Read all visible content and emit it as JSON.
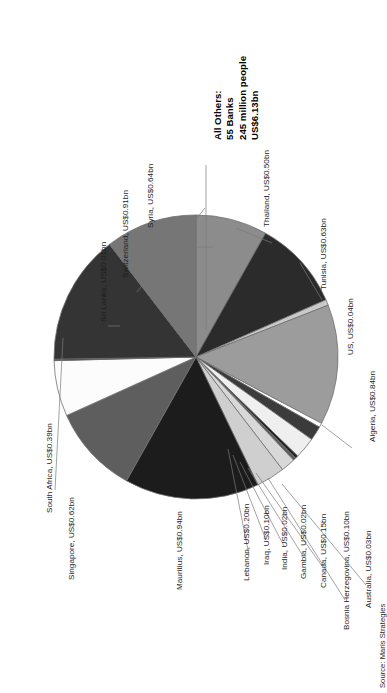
{
  "source_note": "Source: Maris Strategies",
  "callout": {
    "line1": "All Others:",
    "line2": "55 Banks",
    "line3": "245 million people",
    "line4": "US$6.13bn"
  },
  "labels": {
    "thailand": "Thailand, US$0.50bn",
    "tunisia": "Tunisia, US$0.63bn",
    "us": "US, US$0.04bn",
    "algeria": "Algeria, US$0.84bn",
    "australia": "Australia, US$0.03bn",
    "bosnia": "Bosnia Herzegovina, US$0.10bn",
    "canada": "Canada, US$0.15bn",
    "gambia": "Gambia, US$0.02bn",
    "india": "India, US$0.02bn",
    "iraq": "Iraq, US$0.10bn",
    "lebanon": "Lebanon, US$0.20bn",
    "mauritius": "Mauritius, US$0.94bn",
    "singapore": "Singapore, US$0.62bn",
    "south_africa": "South Africa, US$0.39bn",
    "sri_lanka": "Sri Lanka, US$0.01bn",
    "switzerland": "Switzerland, US$0.91bn",
    "syria": "Syria, US$0.64bn"
  },
  "chart_data": {
    "type": "pie",
    "title": "",
    "unit": "US$ billion",
    "legend_position": "none",
    "labels_style": "outside-with-leader-lines",
    "rotation_deg": -90,
    "categories": [
      "Thailand",
      "Tunisia",
      "US",
      "Algeria",
      "Australia",
      "Bosnia Herzegovina",
      "Canada",
      "Gambia",
      "India",
      "Iraq",
      "Lebanon",
      "Mauritius",
      "Singapore",
      "South Africa",
      "Sri Lanka",
      "Switzerland",
      "Syria"
    ],
    "values": [
      0.5,
      0.63,
      0.04,
      0.84,
      0.03,
      0.1,
      0.15,
      0.02,
      0.02,
      0.1,
      0.2,
      0.94,
      0.62,
      0.39,
      0.01,
      0.91,
      0.64
    ],
    "value_labels": [
      "US$0.50bn",
      "US$0.63bn",
      "US$0.04bn",
      "US$0.84bn",
      "US$0.03bn",
      "US$0.10bn",
      "US$0.15bn",
      "US$0.02bn",
      "US$0.02bn",
      "US$0.10bn",
      "US$0.20bn",
      "US$0.94bn",
      "US$0.62bn",
      "US$0.39bn",
      "US$0.01bn",
      "US$0.91bn",
      "US$0.64bn"
    ],
    "colors": [
      "#8c8c8c",
      "#2b2b2b",
      "#c9c9c9",
      "#9c9c9c",
      "#ffffff",
      "#3b3b3b",
      "#efefef",
      "#1f1f1f",
      "#5a5a5a",
      "#d8d8d8",
      "#cfcfcf",
      "#1c1c1c",
      "#5e5e5e",
      "#fcfcfc",
      "#2f2f2f",
      "#343434",
      "#767676"
    ],
    "total": 6.14,
    "annotation": "All Others: 55 Banks, 245 million people, US$6.13bn",
    "source": "Source: Maris Strategies"
  },
  "colors": {
    "slice_stroke": "#6e6e6e",
    "leader_line": "#7a7a7a",
    "text": "#1d1d1d",
    "background": "#ffffff"
  }
}
